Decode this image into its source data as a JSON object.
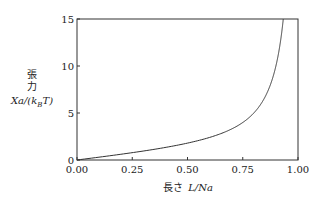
{
  "chart_data": {
    "type": "line",
    "title": "",
    "xlabel": "長さ L/Na",
    "ylabel": "張力 Xa/(k_B T)",
    "ylabel_lines": [
      "張",
      "力",
      "Xa/(k",
      "B",
      "T)"
    ],
    "xlim": [
      0,
      1
    ],
    "ylim": [
      0,
      15
    ],
    "xticks": [
      0,
      0.25,
      0.5,
      0.75,
      1.0
    ],
    "xtick_labels": [
      "0.00",
      "0.25",
      "0.50",
      "0.75",
      "1.00"
    ],
    "yticks": [
      0,
      5,
      10,
      15
    ],
    "ytick_labels": [
      "0",
      "5",
      "10",
      "15"
    ],
    "grid": false,
    "legend": null,
    "series": [
      {
        "name": "inverse Langevin (freely jointed chain)",
        "x": [
          0.0,
          0.0666,
          0.1312,
          0.1919,
          0.2478,
          0.2982,
          0.3868,
          0.4608,
          0.5222,
          0.5736,
          0.6172,
          0.6544,
          0.6866,
          0.7146,
          0.75,
          0.7744,
          0.8,
          0.8214,
          0.8333,
          0.85,
          0.8667,
          0.8889,
          0.9,
          0.9167,
          0.9286,
          0.9333
        ],
        "y": [
          0.0,
          0.2,
          0.4,
          0.6,
          0.8,
          1.0,
          1.4,
          1.8,
          2.2,
          2.6,
          3.0,
          3.4,
          3.8,
          4.2,
          4.0,
          4.43,
          5.0,
          5.6,
          6.0,
          6.67,
          7.5,
          9.0,
          10.0,
          12.0,
          14.0,
          15.0
        ]
      }
    ]
  },
  "labels": {
    "y_zhang": "張",
    "y_li": "力",
    "y_expr_pre": "Xa/(k",
    "y_expr_sub": "B",
    "y_expr_post": "T)",
    "x_prefix": "長さ",
    "x_expr": "L/Na"
  }
}
